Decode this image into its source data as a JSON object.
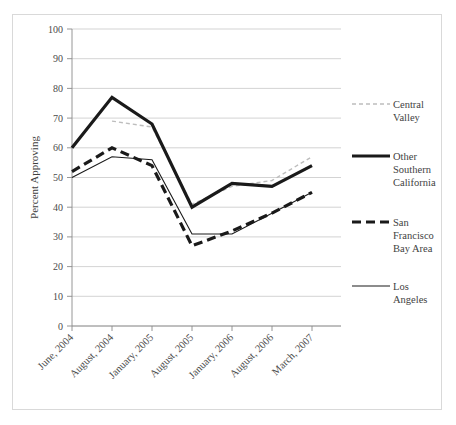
{
  "chart_data": {
    "type": "line",
    "title": "",
    "subtitle": "",
    "xlabel": "",
    "ylabel": "Percent Approving",
    "ylim": [
      0,
      100
    ],
    "ytick_step": 10,
    "yticks": [
      "0",
      "10",
      "20",
      "30",
      "40",
      "50",
      "60",
      "70",
      "80",
      "90",
      "100"
    ],
    "grid": "horizontal",
    "legend_position": "right",
    "categories": [
      "June, 2004",
      "August, 2004",
      "January, 2005",
      "August, 2005",
      "January, 2006",
      "August, 2006",
      "March, 2007"
    ],
    "series": [
      {
        "name": "Central Valley",
        "style": "dashed-light",
        "color": "#bdbdbd",
        "width": 1.4,
        "dash": "4 3",
        "values": [
          null,
          69,
          67,
          41,
          47,
          49,
          57
        ]
      },
      {
        "name": "Other Southern California",
        "style": "solid-thick",
        "color": "#1a1a1a",
        "width": 3.2,
        "dash": "none",
        "values": [
          60,
          77,
          68,
          40,
          48,
          47,
          54
        ]
      },
      {
        "name": "San Francisco Bay Area",
        "style": "dashed-thick",
        "color": "#1a1a1a",
        "width": 3.2,
        "dash": "9 5",
        "values": [
          52,
          60,
          54,
          27,
          32,
          38,
          45
        ]
      },
      {
        "name": "Los Angeles",
        "style": "solid-thin",
        "color": "#1a1a1a",
        "width": 1.1,
        "dash": "none",
        "values": [
          50,
          57,
          56,
          31,
          31,
          38,
          45
        ]
      }
    ]
  },
  "legend": {
    "entries": [
      {
        "label_line1": "Central",
        "label_line2": "Valley",
        "label_line3": ""
      },
      {
        "label_line1": "Other",
        "label_line2": "Southern",
        "label_line3": "California"
      },
      {
        "label_line1": "San",
        "label_line2": "Francisco",
        "label_line3": "Bay Area"
      },
      {
        "label_line1": "Los",
        "label_line2": "Angeles",
        "label_line3": ""
      }
    ]
  },
  "colors": {
    "frame": "#d9d9d9",
    "grid": "#c8c8c8",
    "axis": "#8a8a8a",
    "ink": "#1a1a1a",
    "light_series": "#bdbdbd",
    "background": "#ffffff"
  }
}
